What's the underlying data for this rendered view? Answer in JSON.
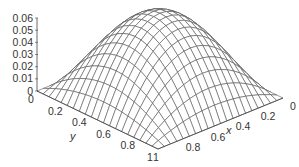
{
  "chart_data": {
    "type": "surface",
    "title": "",
    "function": "z = x(1-x) y(1-y)",
    "xlabel": "x",
    "ylabel": "y",
    "zlabel": "",
    "x_range": [
      0,
      1
    ],
    "y_range": [
      0,
      1
    ],
    "z_range": [
      0,
      0.06
    ],
    "z_ticks": [
      "0",
      "0.01",
      "0.02",
      "0.03",
      "0.04",
      "0.05",
      "0.06"
    ],
    "x_ticks": [
      "0",
      "0.2",
      "0.4",
      "0.6",
      "0.8",
      "1"
    ],
    "y_ticks": [
      "0",
      "0.2",
      "0.4",
      "0.6",
      "0.8",
      "1"
    ],
    "grid_lines_per_axis": 21,
    "peak": {
      "x": 0.5,
      "y": 0.5,
      "z": 0.0625
    },
    "style": "wireframe mesh, gray lines on white",
    "line_color": "#555555"
  }
}
